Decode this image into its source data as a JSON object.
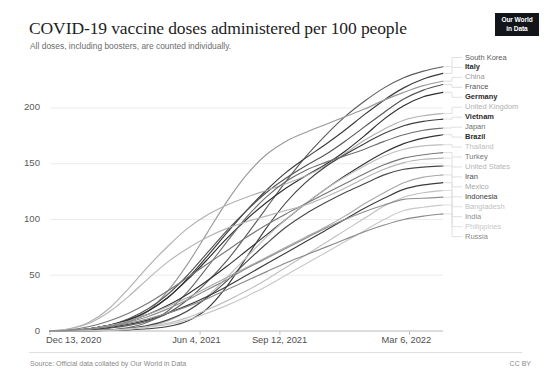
{
  "header": {
    "title": "COVID-19 vaccine doses administered per 100 people",
    "subtitle": "All doses, including boosters, are counted individually.",
    "logo_line1": "Our World",
    "logo_line2": "in Data"
  },
  "footer": {
    "source": "Source: Official data collated by Our World in Data",
    "license": "CC BY"
  },
  "chart_data": {
    "type": "line",
    "title": "COVID-19 vaccine doses administered per 100 people",
    "subtitle": "All doses, including boosters, are counted individually.",
    "xlabel": "",
    "ylabel": "",
    "ylim": [
      0,
      243
    ],
    "xlim": [
      "Dec 13, 2020",
      "Mar 6, 2022"
    ],
    "grid": true,
    "legend_position": "right-direct-labels",
    "y_ticks": [
      0,
      50,
      100,
      150,
      200
    ],
    "x_ticks": [
      "Dec 13, 2020",
      "Jun 4, 2021",
      "Sep 12, 2021",
      "Mar 6, 2022"
    ],
    "x_tick_fractions": [
      0.0,
      0.382,
      0.585,
      0.915
    ],
    "x": [
      0,
      0.05,
      0.1,
      0.15,
      0.2,
      0.25,
      0.3,
      0.35,
      0.4,
      0.45,
      0.5,
      0.55,
      0.6,
      0.65,
      0.7,
      0.75,
      0.8,
      0.85,
      0.9,
      0.95,
      1.0
    ],
    "series": [
      {
        "name": "South Korea",
        "color": "#5c5c5c",
        "final_value": 237,
        "label_weight": "normal",
        "values": [
          0,
          0.3,
          1,
          2.5,
          5,
          9,
          16,
          28,
          44,
          63,
          86,
          110,
          134,
          156,
          175,
          192,
          206,
          218,
          227,
          233,
          237
        ]
      },
      {
        "name": "Italy",
        "color": "#3a3a3a",
        "final_value": 231,
        "label_weight": "bold",
        "values": [
          0,
          0.5,
          2,
          5,
          10,
          18,
          30,
          47,
          67,
          88,
          108,
          126,
          142,
          155,
          167,
          180,
          194,
          207,
          218,
          226,
          231
        ]
      },
      {
        "name": "China",
        "color": "#9a9a9a",
        "final_value": 224,
        "label_weight": "normal",
        "values": [
          0,
          0.2,
          1,
          3,
          8,
          18,
          36,
          60,
          88,
          116,
          140,
          158,
          170,
          178,
          185,
          192,
          199,
          207,
          214,
          220,
          224
        ]
      },
      {
        "name": "France",
        "color": "#555555",
        "final_value": 221,
        "label_weight": "normal",
        "values": [
          0,
          0.4,
          2,
          5,
          11,
          20,
          33,
          50,
          70,
          90,
          108,
          124,
          137,
          148,
          158,
          170,
          183,
          196,
          208,
          216,
          221
        ]
      },
      {
        "name": "Germany",
        "color": "#2e2e2e",
        "final_value": 214,
        "label_weight": "bold",
        "values": [
          0,
          0.5,
          2,
          5,
          10,
          18,
          30,
          46,
          64,
          83,
          100,
          115,
          128,
          139,
          149,
          161,
          175,
          190,
          202,
          210,
          214
        ]
      },
      {
        "name": "United Kingdom",
        "color": "#b0b0b0",
        "final_value": 195,
        "label_weight": "normal",
        "values": [
          0,
          2,
          8,
          20,
          38,
          58,
          76,
          92,
          104,
          113,
          120,
          126,
          132,
          139,
          148,
          159,
          171,
          181,
          189,
          193,
          195
        ]
      },
      {
        "name": "Vietnam",
        "color": "#3f3f3f",
        "final_value": 190,
        "label_weight": "bold",
        "values": [
          0,
          0,
          0.2,
          0.5,
          1,
          2,
          4,
          9,
          20,
          40,
          66,
          92,
          115,
          133,
          147,
          158,
          168,
          177,
          184,
          188,
          190
        ]
      },
      {
        "name": "Japan",
        "color": "#6e6e6e",
        "final_value": 182,
        "label_weight": "normal",
        "values": [
          0,
          0,
          0.3,
          1,
          3,
          8,
          18,
          35,
          57,
          80,
          102,
          120,
          134,
          144,
          151,
          157,
          163,
          170,
          176,
          180,
          182
        ]
      },
      {
        "name": "Brazil",
        "color": "#333333",
        "final_value": 176,
        "label_weight": "bold",
        "values": [
          0,
          0.5,
          2,
          5,
          9,
          15,
          23,
          33,
          45,
          58,
          72,
          86,
          100,
          114,
          127,
          139,
          150,
          160,
          168,
          173,
          176
        ]
      },
      {
        "name": "Thailand",
        "color": "#bdbdbd",
        "final_value": 167,
        "label_weight": "normal",
        "values": [
          0,
          0,
          0.2,
          0.6,
          1.5,
          4,
          9,
          18,
          31,
          48,
          66,
          84,
          100,
          114,
          127,
          138,
          148,
          157,
          163,
          166,
          167
        ]
      },
      {
        "name": "Turkey",
        "color": "#777777",
        "final_value": 160,
        "label_weight": "normal",
        "values": [
          0,
          1,
          4,
          9,
          16,
          25,
          36,
          48,
          60,
          72,
          84,
          95,
          105,
          114,
          123,
          132,
          141,
          149,
          155,
          158,
          160
        ]
      },
      {
        "name": "United States",
        "color": "#b5b5b5",
        "final_value": 155,
        "label_weight": "normal",
        "values": [
          0,
          2,
          7,
          17,
          31,
          47,
          62,
          74,
          84,
          92,
          98,
          103,
          108,
          113,
          120,
          128,
          137,
          145,
          151,
          154,
          155
        ]
      },
      {
        "name": "Iran",
        "color": "#4a4a4a",
        "final_value": 148,
        "label_weight": "normal",
        "values": [
          0,
          0,
          0.3,
          1,
          2.5,
          5,
          10,
          18,
          30,
          45,
          62,
          78,
          93,
          105,
          115,
          124,
          132,
          140,
          145,
          147,
          148
        ]
      },
      {
        "name": "Mexico",
        "color": "#a8a8a8",
        "final_value": 140,
        "final_step": true,
        "label_weight": "normal",
        "values": [
          0,
          0.5,
          2,
          5,
          9,
          15,
          22,
          30,
          39,
          48,
          57,
          66,
          75,
          84,
          93,
          103,
          114,
          124,
          133,
          138,
          140
        ]
      },
      {
        "name": "Indonesia",
        "color": "#3c3c3c",
        "final_value": 133,
        "label_weight": "normal",
        "values": [
          0,
          0.3,
          1,
          3,
          6,
          10,
          16,
          23,
          31,
          40,
          50,
          60,
          70,
          80,
          90,
          100,
          110,
          119,
          127,
          131,
          133
        ]
      },
      {
        "name": "Bangladesh",
        "color": "#c0c0c0",
        "final_value": 126,
        "label_weight": "normal",
        "values": [
          0,
          0,
          0.2,
          0.8,
          2,
          4,
          7,
          12,
          19,
          27,
          36,
          46,
          57,
          68,
          79,
          90,
          101,
          112,
          120,
          124,
          126
        ]
      },
      {
        "name": "India",
        "color": "#8f8f8f",
        "final_value": 120,
        "label_weight": "normal",
        "values": [
          0,
          0.3,
          1.5,
          4,
          8,
          13,
          20,
          28,
          37,
          46,
          56,
          65,
          74,
          83,
          92,
          100,
          107,
          113,
          118,
          119,
          120
        ]
      },
      {
        "name": "Philippines",
        "color": "#c8c8c8",
        "final_value": 113,
        "label_weight": "normal",
        "values": [
          0,
          0,
          0.2,
          0.7,
          1.8,
          3.5,
          6,
          10,
          16,
          23,
          31,
          40,
          50,
          60,
          70,
          80,
          90,
          100,
          108,
          111,
          113
        ]
      },
      {
        "name": "Russia",
        "color": "#8a8a8a",
        "final_value": 105,
        "label_weight": "normal",
        "values": [
          0,
          0.5,
          2,
          4,
          7,
          11,
          16,
          22,
          29,
          37,
          45,
          53,
          61,
          68,
          75,
          82,
          89,
          95,
          100,
          103,
          105
        ]
      }
    ]
  }
}
